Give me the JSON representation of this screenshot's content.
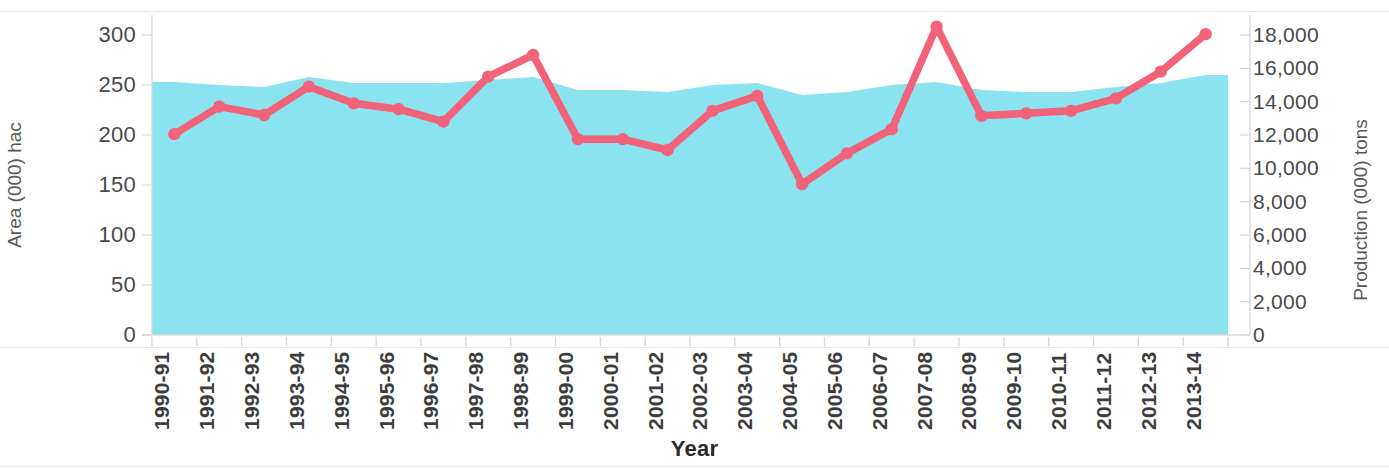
{
  "chart_data": {
    "type": "area",
    "title": "",
    "xlabel": "Year",
    "categories": [
      "1990-91",
      "1991-92",
      "1992-93",
      "1993-94",
      "1994-95",
      "1995-96",
      "1996-97",
      "1997-98",
      "1998-99",
      "1999-00",
      "2000-01",
      "2001-02",
      "2002-03",
      "2003-04",
      "2004-05",
      "2005-06",
      "2006-07",
      "2007-08",
      "2008-09",
      "2009-10",
      "2010-11",
      "2011-12",
      "2012-13",
      "2013-14"
    ],
    "series": [
      {
        "name": "Area (000) hac",
        "type": "area",
        "axis": "left",
        "color": "#8BE3F0",
        "values": [
          253,
          250,
          248,
          258,
          252,
          252,
          252,
          255,
          258,
          245,
          245,
          243,
          250,
          252,
          240,
          243,
          250,
          253,
          245,
          243,
          243,
          248,
          252,
          260
        ]
      },
      {
        "name": "Production (000) tons",
        "type": "line",
        "axis": "right",
        "color": "#F2637A",
        "values": [
          12050,
          13700,
          13200,
          14900,
          13900,
          13550,
          12800,
          15500,
          16800,
          11750,
          11750,
          11100,
          13450,
          14350,
          9050,
          10900,
          12350,
          18500,
          13150,
          13300,
          13450,
          14200,
          15800,
          18050
        ]
      }
    ],
    "left_axis": {
      "label": "Area (000) hac",
      "ticks": [
        "0",
        "50",
        "100",
        "150",
        "200",
        "250",
        "300"
      ],
      "tick_values": [
        0,
        50,
        100,
        150,
        200,
        250,
        300
      ],
      "min": 0,
      "max": 300
    },
    "right_axis": {
      "label": "Production (000) tons",
      "ticks": [
        "0",
        "2,000",
        "4,000",
        "6,000",
        "8,000",
        "10,000",
        "12,000",
        "14,000",
        "16,000",
        "18,000"
      ],
      "tick_values": [
        0,
        2000,
        4000,
        6000,
        8000,
        10000,
        12000,
        14000,
        16000,
        18000
      ],
      "min": 0,
      "max": 18000
    },
    "grid": false,
    "legend": "none",
    "colors": {
      "area_fill": "#8BE3F0",
      "line": "#F2637A",
      "marker": "#F2637A",
      "axis_text": "#4a4a4a",
      "title_text": "#2b2b2b",
      "background": "#ffffff"
    }
  }
}
